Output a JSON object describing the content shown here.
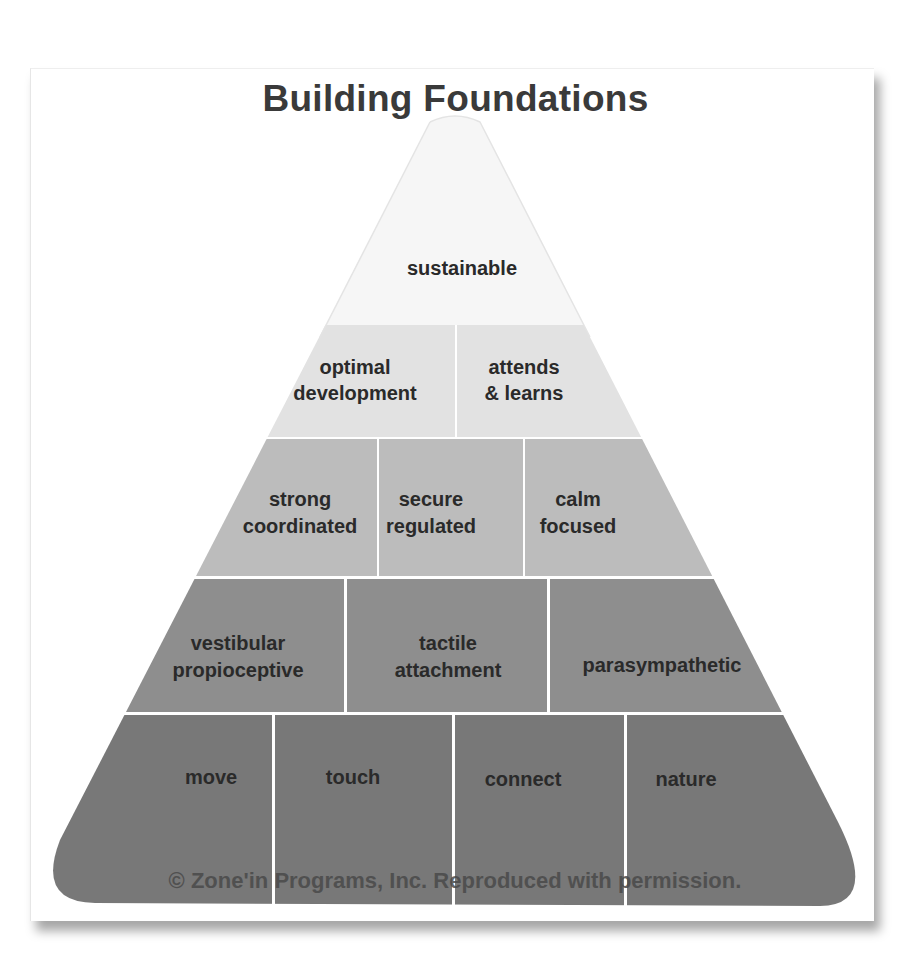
{
  "title": "Building Foundations",
  "colors": {
    "tier1": "#f7f7f7",
    "tier2": "#e3e3e3",
    "tier3": "#bdbdbd",
    "tier4": "#8f8f8f",
    "tier5": "#7a7a7a",
    "divider": "#f4f4f4",
    "text": "#2a2a2a"
  },
  "tiers": [
    {
      "level": 1,
      "cells": [
        {
          "lines": [
            "sustainable"
          ]
        }
      ]
    },
    {
      "level": 2,
      "cells": [
        {
          "lines": [
            "optimal",
            "development"
          ]
        },
        {
          "lines": [
            "attends",
            "& learns"
          ]
        }
      ]
    },
    {
      "level": 3,
      "cells": [
        {
          "lines": [
            "strong",
            "coordinated"
          ]
        },
        {
          "lines": [
            "secure",
            "regulated"
          ]
        },
        {
          "lines": [
            "calm",
            "focused"
          ]
        }
      ]
    },
    {
      "level": 4,
      "cells": [
        {
          "lines": [
            "vestibular",
            "propioceptive"
          ]
        },
        {
          "lines": [
            "tactile",
            "attachment"
          ]
        },
        {
          "lines": [
            "parasympathetic"
          ]
        }
      ]
    },
    {
      "level": 5,
      "cells": [
        {
          "lines": [
            "move"
          ]
        },
        {
          "lines": [
            "touch"
          ]
        },
        {
          "lines": [
            "connect"
          ]
        },
        {
          "lines": [
            "nature"
          ]
        }
      ]
    }
  ],
  "copyright": "© Zone'in Programs, Inc. Reproduced with permission."
}
